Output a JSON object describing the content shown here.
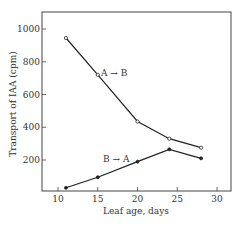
{
  "chart_data": {
    "type": "line",
    "title": "",
    "xlabel": "Leaf age, days",
    "ylabel": "Transport of IAA (cpm)",
    "xlim": [
      8,
      32
    ],
    "ylim": [
      0,
      1100
    ],
    "xticks": [
      10,
      15,
      20,
      25,
      30
    ],
    "yticks": [
      200,
      400,
      600,
      800,
      1000
    ],
    "grid": false,
    "legend": "inline labels",
    "series": [
      {
        "name": "A → B",
        "marker": "open-circle",
        "x": [
          11,
          15,
          20,
          24,
          28
        ],
        "y": [
          945,
          720,
          435,
          330,
          275
        ]
      },
      {
        "name": "B → A",
        "marker": "filled-circle",
        "x": [
          11,
          15,
          20,
          24,
          28
        ],
        "y": [
          30,
          95,
          190,
          265,
          210
        ]
      }
    ],
    "annotations": [
      {
        "text": "A → B",
        "near": {
          "x": 15,
          "y": 720
        }
      },
      {
        "text": "B → A",
        "near": {
          "x": 17.5,
          "y": 260
        }
      }
    ]
  },
  "colors": {
    "line": "#222222",
    "axis": "#444444",
    "text": "#333333",
    "background": "#ffffff"
  }
}
